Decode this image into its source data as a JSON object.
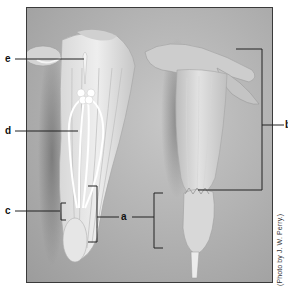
{
  "figure": {
    "type": "labeled-photograph",
    "labels": [
      {
        "id": "a",
        "text": "a"
      },
      {
        "id": "b",
        "text": "b"
      },
      {
        "id": "c",
        "text": "c"
      },
      {
        "id": "d",
        "text": "d"
      },
      {
        "id": "e",
        "text": "e"
      }
    ],
    "credit": "(Photo by J. W. Perry.)"
  },
  "colors": {
    "background": "#ffffff",
    "photo_background": "#b4b4b4",
    "flower_light": "#e8e8e8",
    "leader_line": "#222222"
  }
}
